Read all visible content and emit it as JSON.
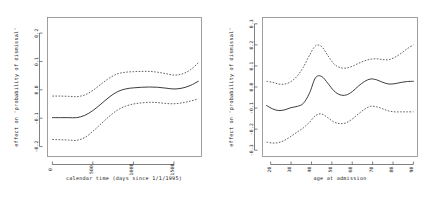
{
  "figure": {
    "background": "#ffffff",
    "ink_color": "#333333",
    "frame_color": "#888888",
    "panel_count": 2
  },
  "chart_data": [
    {
      "type": "line",
      "panel": "left",
      "title": "",
      "xlabel": "calendar time (days since 1/1/1995)",
      "ylabel": "effect on 'probability of dismissal'",
      "xlim": [
        -60,
        1840
      ],
      "ylim": [
        -0.235,
        0.255
      ],
      "xticks": [
        0,
        500,
        1000,
        1500
      ],
      "xticklabels": [
        "0",
        "500",
        "1000",
        "1500"
      ],
      "yticks": [
        -0.2,
        -0.1,
        0.0,
        0.1,
        0.2
      ],
      "yticklabels": [
        "-0.2",
        "-0.1",
        "0.0",
        "0.1",
        "0.2"
      ],
      "grid": false,
      "legend": "none",
      "x": [
        0,
        100,
        200,
        300,
        400,
        500,
        600,
        700,
        800,
        900,
        1000,
        1100,
        1200,
        1300,
        1400,
        1500,
        1600,
        1700,
        1800
      ],
      "series": [
        {
          "name": "fit",
          "style": "solid",
          "values": [
            -0.098,
            -0.098,
            -0.098,
            -0.098,
            -0.09,
            -0.073,
            -0.05,
            -0.026,
            -0.007,
            0.003,
            0.007,
            0.009,
            0.01,
            0.009,
            0.006,
            0.003,
            0.006,
            0.015,
            0.03
          ]
        },
        {
          "name": "upper 95% CI",
          "style": "dashed",
          "values": [
            -0.022,
            -0.022,
            -0.023,
            -0.024,
            -0.018,
            -0.002,
            0.02,
            0.041,
            0.056,
            0.062,
            0.064,
            0.065,
            0.065,
            0.062,
            0.057,
            0.052,
            0.056,
            0.07,
            0.095
          ]
        },
        {
          "name": "lower 95% CI",
          "style": "dashed",
          "values": [
            -0.175,
            -0.176,
            -0.177,
            -0.178,
            -0.168,
            -0.146,
            -0.12,
            -0.094,
            -0.072,
            -0.058,
            -0.05,
            -0.046,
            -0.044,
            -0.045,
            -0.048,
            -0.049,
            -0.046,
            -0.04,
            -0.032
          ]
        }
      ]
    },
    {
      "type": "line",
      "panel": "right",
      "title": "",
      "xlabel": "age at admission",
      "ylabel": "effect on 'probability of dismissal'",
      "xlim": [
        16,
        92
      ],
      "ylim": [
        -0.33,
        0.33
      ],
      "xticks": [
        20,
        30,
        40,
        50,
        60,
        70,
        80,
        90
      ],
      "xticklabels": [
        "20",
        "30",
        "40",
        "50",
        "60",
        "70",
        "80",
        "90"
      ],
      "yticks": [
        -0.3,
        -0.2,
        -0.1,
        0.0,
        0.1,
        0.2,
        0.3
      ],
      "yticklabels": [
        "-0.3",
        "-0.2",
        "-0.1",
        "0.0",
        "0.1",
        "0.2",
        "0.3"
      ],
      "grid": false,
      "legend": "none",
      "x": [
        18,
        21,
        24,
        27,
        30,
        33,
        36,
        39,
        42,
        45,
        48,
        51,
        54,
        57,
        60,
        63,
        66,
        69,
        72,
        75,
        78,
        81,
        84,
        87,
        90
      ],
      "series": [
        {
          "name": "fit",
          "style": "solid",
          "values": [
            -0.088,
            -0.104,
            -0.112,
            -0.108,
            -0.098,
            -0.092,
            -0.078,
            -0.03,
            0.044,
            0.05,
            0.018,
            -0.018,
            -0.037,
            -0.038,
            -0.022,
            0.004,
            0.026,
            0.038,
            0.034,
            0.022,
            0.014,
            0.016,
            0.022,
            0.026,
            0.027
          ]
        },
        {
          "name": "upper 95% CI",
          "style": "dashed",
          "values": [
            0.027,
            0.022,
            0.014,
            0.014,
            0.026,
            0.052,
            0.094,
            0.15,
            0.196,
            0.192,
            0.15,
            0.11,
            0.092,
            0.09,
            0.098,
            0.112,
            0.124,
            0.132,
            0.134,
            0.13,
            0.13,
            0.142,
            0.16,
            0.182,
            0.2
          ]
        },
        {
          "name": "lower 95% CI",
          "style": "dashed",
          "values": [
            -0.262,
            -0.266,
            -0.264,
            -0.252,
            -0.234,
            -0.214,
            -0.194,
            -0.168,
            -0.136,
            -0.128,
            -0.146,
            -0.166,
            -0.174,
            -0.17,
            -0.152,
            -0.128,
            -0.106,
            -0.092,
            -0.094,
            -0.104,
            -0.114,
            -0.118,
            -0.118,
            -0.118,
            -0.118
          ]
        }
      ]
    }
  ]
}
